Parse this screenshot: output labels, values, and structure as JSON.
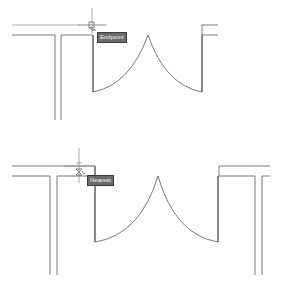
{
  "app": "CAD drawing viewport",
  "colors": {
    "background": "#ffffff",
    "line": "#444444",
    "tooltip_bg": "#6b6b6b",
    "tooltip_text": "#f2f2f2"
  },
  "panels": [
    {
      "id": "top",
      "snap_marker": "endpoint-snap-marker",
      "tooltip": "Endpoint"
    },
    {
      "id": "bottom",
      "snap_marker": "nearest-snap-marker",
      "tooltip": "Nearest"
    }
  ]
}
